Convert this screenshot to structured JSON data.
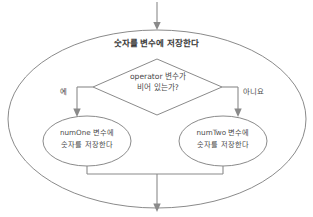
{
  "diagram": {
    "type": "flowchart",
    "background_color": "#ffffff",
    "stroke_color": "#7d7d7d",
    "text_color": "#4a4a4a",
    "outer_process": {
      "shape": "ellipse",
      "label": "숫자를 변수에 저장한다"
    },
    "decision": {
      "shape": "diamond",
      "line1": "operator 변수가",
      "line2": "비어 있는가?"
    },
    "branches": [
      {
        "name": "yes-branch",
        "label": "예"
      },
      {
        "name": "no-branch",
        "label": "아니요"
      }
    ],
    "left_process": {
      "shape": "ellipse",
      "line1": "numOne 변수에",
      "line2": "숫자를 저장한다"
    },
    "right_process": {
      "shape": "ellipse",
      "line1": "numTwo 변수에",
      "line2": "숫자를 저장한다"
    },
    "connectors": [
      {
        "name": "entry-arrow",
        "direction": "down"
      },
      {
        "name": "exit-arrow",
        "direction": "down"
      },
      {
        "name": "merge-line",
        "direction": "horizontal"
      }
    ]
  }
}
